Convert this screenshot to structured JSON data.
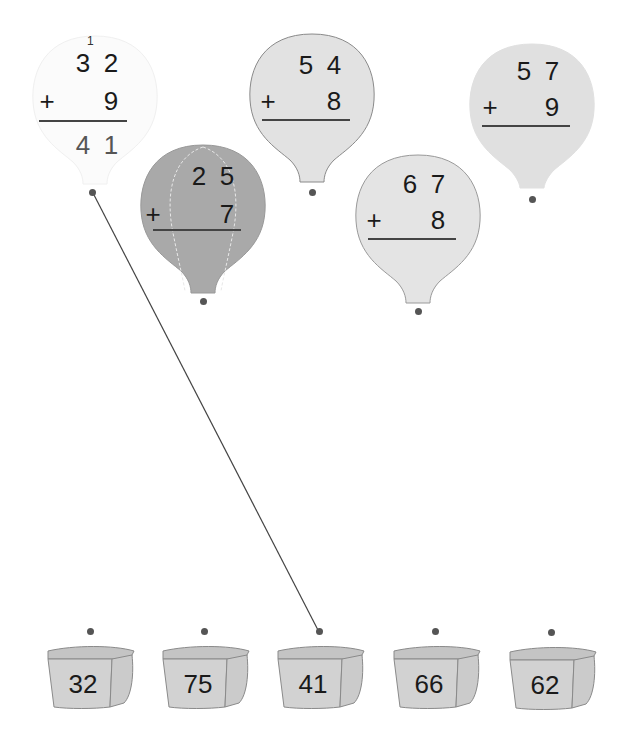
{
  "colors": {
    "balloon_solved": "#fbfbfb",
    "balloon_light": "#e2e2e2",
    "balloon_dark": "#a9a9a9",
    "basket_fill": "#cfcfcf",
    "dot": "#555555",
    "line": "#444444"
  },
  "balloons": [
    {
      "id": "b1",
      "top_tens": "3",
      "top_ones": "2",
      "operator": "+",
      "add_ones": "9",
      "carry": "1",
      "answer_tens": "4",
      "answer_ones": "1",
      "solved": true
    },
    {
      "id": "b2",
      "top_tens": "2",
      "top_ones": "5",
      "operator": "+",
      "add_ones": "7",
      "carry": "",
      "answer_tens": "",
      "answer_ones": "",
      "solved": false
    },
    {
      "id": "b3",
      "top_tens": "5",
      "top_ones": "4",
      "operator": "+",
      "add_ones": "8",
      "carry": "",
      "answer_tens": "",
      "answer_ones": "",
      "solved": false
    },
    {
      "id": "b4",
      "top_tens": "6",
      "top_ones": "7",
      "operator": "+",
      "add_ones": "8",
      "carry": "",
      "answer_tens": "",
      "answer_ones": "",
      "solved": false
    },
    {
      "id": "b5",
      "top_tens": "5",
      "top_ones": "7",
      "operator": "+",
      "add_ones": "9",
      "carry": "",
      "answer_tens": "",
      "answer_ones": "",
      "solved": false
    }
  ],
  "baskets": [
    {
      "label": "32"
    },
    {
      "label": "75"
    },
    {
      "label": "41"
    },
    {
      "label": "66"
    },
    {
      "label": "62"
    }
  ],
  "connections": [
    {
      "from_balloon": 0,
      "to_basket": 2
    }
  ]
}
